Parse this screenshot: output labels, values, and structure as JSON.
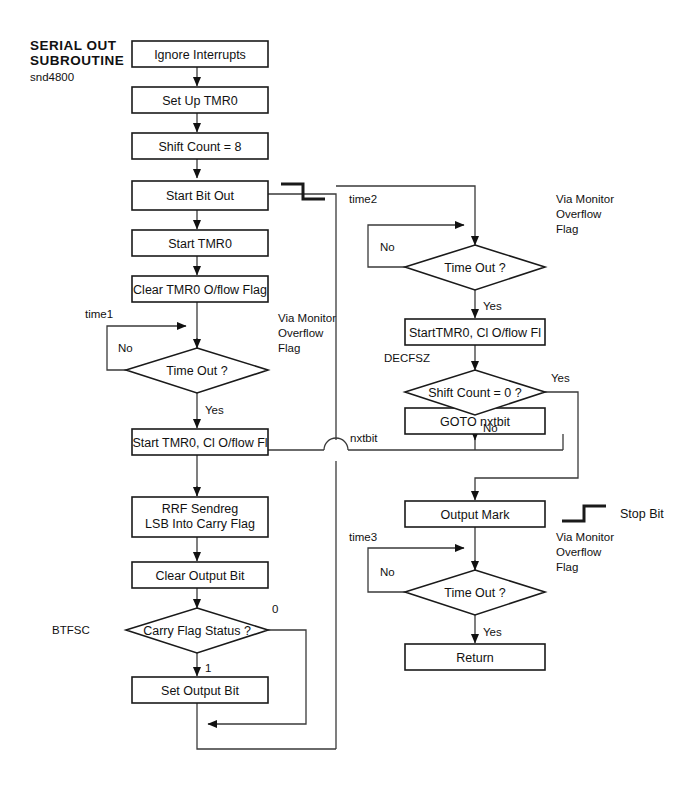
{
  "diagram": {
    "title_line1": "SERIAL  OUT",
    "title_line2": "SUBROUTINE",
    "subtitle": "snd4800",
    "stop_bit_label": "Stop Bit"
  },
  "nodes": {
    "ignore_interrupts": "Ignore Interrupts",
    "set_up_tmr0": "Set Up TMR0",
    "shift_count_8": "Shift Count = 8",
    "start_bit_out": "Start Bit Out",
    "start_tmr0": "Start TMR0",
    "clear_oflow_flag": "Clear TMR0 O/flow Flag",
    "time_out_1": "Time Out ?",
    "start_tmr0_cl_1": "Start TMR0, Cl O/flow Fl",
    "rrf_sendreg": "RRF Sendreg",
    "rrf_sendreg2": "LSB Into Carry Flag",
    "clear_output_bit": "Clear Output Bit",
    "carry_flag_status": "Carry Flag Status ?",
    "set_output_bit": "Set Output Bit",
    "time_out_2": "Time Out ?",
    "start_tmr0_cl_2": "StartTMR0, Cl  O/flow Fl",
    "shift_count_0": "Shift Count = 0 ?",
    "goto_nxtbit": "GOTO nxtbit",
    "output_mark": "Output Mark",
    "time_out_3": "Time Out ?",
    "return": "Return"
  },
  "labels": {
    "time1": "time1",
    "time2": "time2",
    "time3": "time3",
    "nxtbit": "nxtbit",
    "btfsc": "BTFSC",
    "decfsz": "DECFSZ",
    "no_1": "No",
    "no_2": "No",
    "no_3": "No",
    "no_4": "No",
    "yes_1": "Yes",
    "yes_2": "Yes",
    "yes_3": "Yes",
    "yes_4": "Yes",
    "zero": "0",
    "one": "1",
    "via1_a": "Via Monitor",
    "via1_b": "Overflow",
    "via1_c": "Flag",
    "via2_a": "Via Monitor",
    "via2_b": "Overflow",
    "via2_c": "Flag",
    "via3_a": "Via Monitor",
    "via3_b": "Overflow",
    "via3_c": "Flag"
  },
  "colors": {
    "stroke": "#1a1a1a",
    "connector": "#3a3a3a",
    "background": "#ffffff"
  }
}
